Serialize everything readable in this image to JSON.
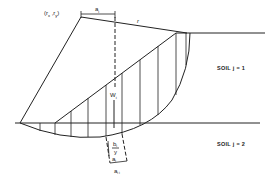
{
  "figure": {
    "type": "slope-stability-method-of-slices",
    "labels": {
      "center": "(r",
      "center_x_sub": "x",
      "center_sep": " ,r",
      "center_y_sub": "y",
      "center_close": ")",
      "moment_arm": "a",
      "moment_arm_sub": "i",
      "radius": "r",
      "weight": "W",
      "weight_sub": "i",
      "slice_width_num": "b",
      "slice_width_num_sub": "i",
      "slice_width_den": "y",
      "slice_base": "a",
      "slice_base_sub": "i",
      "angle": "a",
      "angle_sub": "i i"
    },
    "soil_layers": [
      {
        "label": "SOIL  j = 1"
      },
      {
        "label": "SOIL  j = 2"
      }
    ],
    "slices_x": [
      40,
      55,
      71,
      88,
      106,
      122,
      140,
      158,
      176,
      187
    ]
  }
}
